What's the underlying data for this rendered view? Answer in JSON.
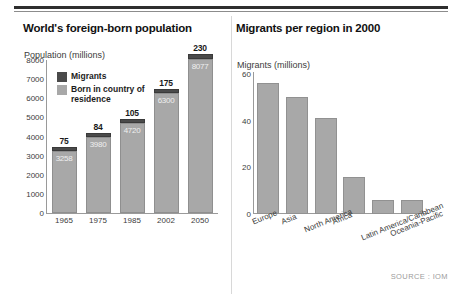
{
  "source_note": "SOURCE : IOM",
  "left": {
    "title": "World's foreign-born population",
    "axis_caption": "Population (millions)",
    "legend": [
      {
        "key": "migrants",
        "label": "Migrants",
        "color": "#4a4a4a"
      },
      {
        "key": "residence",
        "label": "Born in country of residence",
        "color": "#a8a8a8"
      }
    ]
  },
  "right": {
    "title": "Migrants per region in 2000",
    "axis_caption": "Migrants (millions)"
  },
  "chart_data": [
    {
      "type": "bar",
      "title": "World's foreign-born population",
      "xlabel": "",
      "ylabel": "Population (millions)",
      "ylim": [
        0,
        8000
      ],
      "yticks": [
        0,
        1000,
        2000,
        3000,
        4000,
        5000,
        6000,
        7000,
        8000
      ],
      "grid": false,
      "stacked": true,
      "legend_position": "inside-top-left",
      "categories": [
        "1965",
        "1975",
        "1985",
        "2002",
        "2050"
      ],
      "series": [
        {
          "name": "Born in country of residence",
          "color": "#a8a8a8",
          "values": [
            3258,
            3980,
            4720,
            6300,
            8077
          ]
        },
        {
          "name": "Migrants",
          "color": "#4a4a4a",
          "values": [
            75,
            84,
            105,
            175,
            230
          ]
        }
      ],
      "data_labels": {
        "residence": [
          "3258",
          "3980",
          "4720",
          "6300",
          "8077"
        ],
        "migrants": [
          "75",
          "84",
          "105",
          "175",
          "230"
        ]
      }
    },
    {
      "type": "bar",
      "title": "Migrants per region in 2000",
      "xlabel": "",
      "ylabel": "Migrants (millions)",
      "ylim": [
        0,
        60
      ],
      "yticks": [
        0,
        20,
        40,
        60
      ],
      "grid": false,
      "categories": [
        "Europe",
        "Asia",
        "North America",
        "Africa",
        "Latin America/Caribbean",
        "Oceania-Pacific"
      ],
      "values": [
        56,
        50,
        41,
        16,
        6,
        6
      ],
      "color": "#a8a8a8"
    }
  ]
}
